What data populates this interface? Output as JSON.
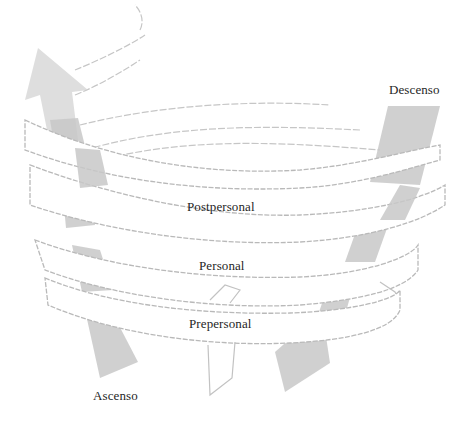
{
  "diagram": {
    "type": "spiral-levels",
    "labels": {
      "descent": "Descenso",
      "ascent": "Ascenso",
      "levels": [
        "Postpersonal",
        "Personal",
        "Prepersonal"
      ]
    },
    "arrows": [
      {
        "name": "ascent-arrow",
        "direction": "up",
        "side": "left"
      },
      {
        "name": "descent-arrow",
        "direction": "down",
        "side": "right"
      }
    ],
    "colors": {
      "arrow_fill": "#c8c8c8",
      "band_stroke": "#b9b9b9",
      "text": "#1f1f1f",
      "background": "#ffffff"
    }
  }
}
